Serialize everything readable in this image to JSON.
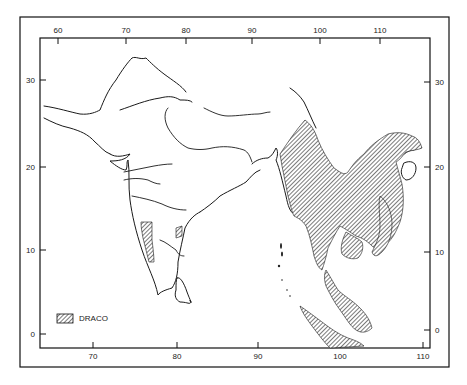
{
  "map": {
    "title": "",
    "subject": "Distribution of Draco (flying lizards) in South and Southeast Asia",
    "colors": {
      "ink": "#1a1a1a",
      "paper": "#ffffff",
      "hatch": "#333333"
    },
    "axes": {
      "top_longitude_ticks": [
        "60",
        "70",
        "80",
        "90",
        "100",
        "110"
      ],
      "bottom_longitude_ticks": [
        "70",
        "80",
        "90",
        "100",
        "110"
      ],
      "left_latitude_ticks": [
        "30",
        "20",
        "10",
        "0"
      ],
      "right_latitude_ticks": [
        "30",
        "20",
        "10",
        "0"
      ]
    },
    "legend": {
      "items": [
        {
          "label": "DRACO",
          "swatch": "diagonal-hatch"
        }
      ]
    },
    "regions": [
      {
        "name": "indochina-range",
        "description": "Myanmar, Thailand, Laos, Cambodia, Vietnam, southern China"
      },
      {
        "name": "malay-peninsula-range",
        "description": "Malay Peninsula"
      },
      {
        "name": "sumatra-range",
        "description": "Sumatra"
      },
      {
        "name": "western-ghats-range",
        "description": "Western Ghats, southwest India"
      },
      {
        "name": "eastern-ghats-fragment",
        "description": "Small hatched patch, east coast India"
      }
    ]
  }
}
